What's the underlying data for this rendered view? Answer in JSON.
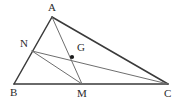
{
  "figure": {
    "type": "geometry-diagram",
    "width": 181,
    "height": 103,
    "background_color": "#ffffff",
    "stroke_color_outline": "#3a3a3a",
    "stroke_color_inner": "#6e6e6e",
    "point_color": "#1a1a1a",
    "label_color": "#2b2b2b"
  },
  "points": {
    "A": {
      "label": "A",
      "x": 52,
      "y": 17,
      "label_x": 48,
      "label_y": 2
    },
    "B": {
      "label": "B",
      "x": 14,
      "y": 84,
      "label_x": 10,
      "label_y": 87
    },
    "C": {
      "label": "C",
      "x": 168,
      "y": 84,
      "label_x": 164,
      "label_y": 88
    },
    "N": {
      "label": "N",
      "x": 32,
      "y": 51,
      "label_x": 20,
      "label_y": 38
    },
    "M": {
      "label": "M",
      "x": 82,
      "y": 84,
      "label_x": 77,
      "label_y": 88
    },
    "G": {
      "label": "G",
      "x": 72,
      "y": 57,
      "label_x": 77,
      "label_y": 42
    }
  },
  "segments": [
    {
      "name": "side-AB",
      "from": "A",
      "to": "B",
      "weight": "thick"
    },
    {
      "name": "side-AC",
      "from": "A",
      "to": "C",
      "weight": "thick"
    },
    {
      "name": "side-BC",
      "from": "B",
      "to": "C",
      "weight": "thick"
    },
    {
      "name": "cevian-AM",
      "from": "A",
      "to": "M",
      "weight": "thin"
    },
    {
      "name": "cevian-NC",
      "from": "N",
      "to": "C",
      "weight": "thin"
    },
    {
      "name": "segment-NM",
      "from": "N",
      "to": "M",
      "weight": "thin"
    }
  ],
  "marked_points": [
    {
      "name": "centroid-dot",
      "at": "G",
      "radius": 2.1
    }
  ]
}
